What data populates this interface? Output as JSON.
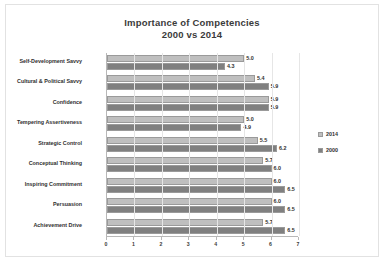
{
  "chart_data": {
    "type": "bar",
    "orientation": "horizontal",
    "title": "Importance of Competencies",
    "subtitle": "2000 vs 2014",
    "xlabel": "",
    "ylabel": "",
    "xlim": [
      0,
      7
    ],
    "xticks": [
      "0",
      "1",
      "2",
      "3",
      "4",
      "5",
      "6",
      "7"
    ],
    "grid": true,
    "legend_position": "right",
    "categories": [
      "Self-Development Savvy",
      "Cultural & Political Savvy",
      "Confidence",
      "Tempering Assertiveness",
      "Strategic Control",
      "Conceptual Thinking",
      "Inspiring Commitment",
      "Persuasion",
      "Achievement Drive"
    ],
    "series": [
      {
        "name": "2014",
        "color": "#bfbfbf",
        "values": [
          5.0,
          5.4,
          5.9,
          5.0,
          5.5,
          5.7,
          6.0,
          6.0,
          5.7
        ],
        "labels": [
          "5.0",
          "5.4",
          "5.9",
          "5.0",
          "5.5",
          "5.7",
          "6.0",
          "6.0",
          "5.7"
        ]
      },
      {
        "name": "2000",
        "color": "#808080",
        "values": [
          4.3,
          5.9,
          5.9,
          4.9,
          6.2,
          6.0,
          6.5,
          6.5,
          6.5
        ],
        "labels": [
          "4.3",
          "5.9",
          "5.9",
          "4.9",
          "6.2",
          "6.0",
          "6.5",
          "6.5",
          "6.5"
        ]
      }
    ]
  },
  "legend": {
    "items": [
      {
        "label": "2014"
      },
      {
        "label": "2000"
      }
    ]
  }
}
